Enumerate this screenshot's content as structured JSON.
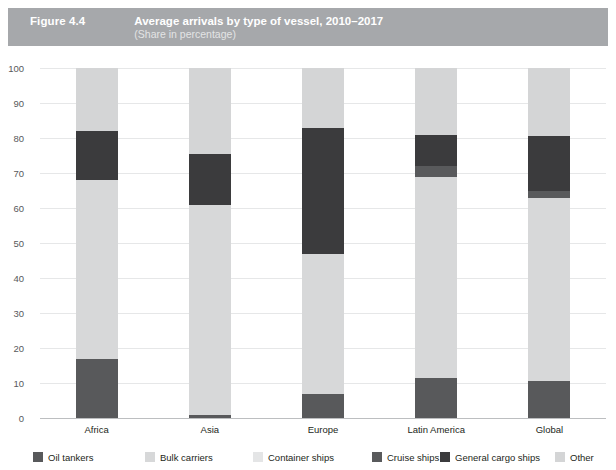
{
  "header": {
    "figure_number": "Figure 4.4",
    "title": "Average arrivals by type of vessel, 2010–2017",
    "subtitle": "(Share in percentage)",
    "band_color": "#a6a8ab"
  },
  "chart_data": {
    "type": "bar",
    "stacked": true,
    "title": "Average arrivals by type of vessel, 2010–2017",
    "subtitle": "(Share in percentage)",
    "xlabel": "",
    "ylabel": "",
    "ylim": [
      0,
      100
    ],
    "yticks": [
      0,
      10,
      20,
      30,
      40,
      50,
      60,
      70,
      80,
      90,
      100
    ],
    "grid": true,
    "legend_position": "bottom",
    "categories": [
      "Africa",
      "Asia",
      "Europe",
      "Latin America",
      "Global"
    ],
    "series": [
      {
        "name": "Oil tankers",
        "color": "#58595b",
        "values": [
          17,
          1,
          7,
          11.5,
          10.5
        ]
      },
      {
        "name": "Bulk carriers",
        "color": "#d7d8d9",
        "values": [
          51,
          60,
          40,
          57.5,
          52.5
        ]
      },
      {
        "name": "Container ships",
        "color": "#e4e5e6",
        "values": [
          0,
          0,
          0,
          0,
          0
        ]
      },
      {
        "name": "Cruise ships",
        "color": "#595a5c",
        "values": [
          0,
          0,
          0,
          3,
          2
        ]
      },
      {
        "name": "General cargo ships",
        "color": "#3b3b3d",
        "values": [
          14,
          14.5,
          36,
          9,
          15.5
        ]
      },
      {
        "name": "Other",
        "color": "#d4d5d6",
        "values": [
          18,
          24.5,
          17,
          19,
          19.5
        ]
      }
    ],
    "segment_boundaries": {
      "Africa": [
        0,
        17,
        68,
        68,
        68,
        82,
        100
      ],
      "Asia": [
        0,
        1,
        61,
        61,
        61,
        75.5,
        100
      ],
      "Europe": [
        0,
        7,
        47,
        47,
        47,
        83,
        100
      ],
      "Latin America": [
        0,
        11.5,
        69,
        69,
        72,
        81,
        100
      ],
      "Global": [
        0,
        10.5,
        63,
        63,
        65,
        80.5,
        100
      ]
    }
  },
  "legend": {
    "items": [
      {
        "label": "Oil tankers",
        "color": "#58595b"
      },
      {
        "label": "Bulk carriers",
        "color": "#d7d8d9"
      },
      {
        "label": "Container ships",
        "color": "#e4e5e6"
      },
      {
        "label": "Cruise ships",
        "color": "#595a5c"
      },
      {
        "label": "General cargo ships",
        "color": "#3b3b3d"
      },
      {
        "label": "Other",
        "color": "#d4d5d6"
      }
    ]
  }
}
